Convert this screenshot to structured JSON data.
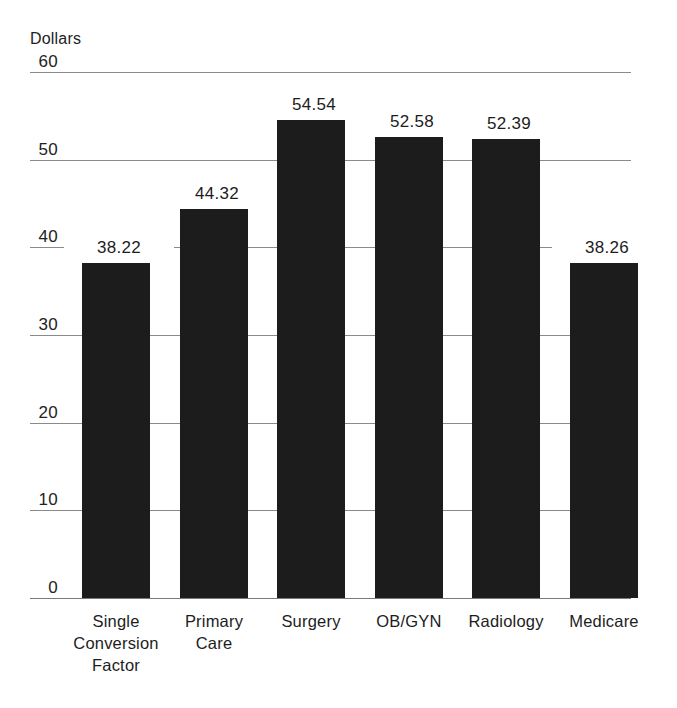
{
  "chart_data": {
    "type": "bar",
    "title": "",
    "subtitle": "",
    "xlabel": "",
    "ylabel": "Dollars",
    "axis_caption": "Dollars",
    "categories": [
      "Single Conversion Factor",
      "Primary Care",
      "Surgery",
      "OB/GYN",
      "Radiology",
      "Medicare"
    ],
    "category_lines": [
      [
        "Single",
        "Conversion",
        "Factor"
      ],
      [
        "Primary",
        "Care"
      ],
      [
        "Surgery"
      ],
      [
        "OB/GYN"
      ],
      [
        "Radiology"
      ],
      [
        "Medicare"
      ]
    ],
    "values": [
      38.22,
      44.32,
      54.54,
      52.58,
      52.39,
      38.26
    ],
    "value_labels": [
      "38.22",
      "44.32",
      "54.54",
      "52.58",
      "52.39",
      "38.26"
    ],
    "ylim": [
      0,
      60
    ],
    "yticks": [
      0,
      10,
      20,
      30,
      40,
      50,
      60
    ],
    "ytick_labels": [
      "0",
      "10",
      "20",
      "30",
      "40",
      "50",
      "60"
    ],
    "grid": true,
    "legend": "none",
    "bar_color": "#1c1c1c",
    "grid_color": "#8a8a8a",
    "text_color": "#1d1d1d",
    "background_color": "#ffffff"
  },
  "geometry": {
    "plot_left": 82,
    "plot_right": 633,
    "grid_left": 30,
    "grid_right": 631,
    "baseline_y": 598,
    "top_y": 72,
    "px_per_unit": 8.767,
    "bar_width": 68,
    "bar_pitch": 97.5,
    "label_top_y": 611
  }
}
